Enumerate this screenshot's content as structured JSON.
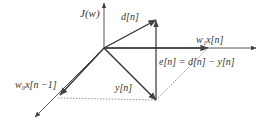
{
  "figure": {
    "labels": {
      "cost_axis": "J(w)",
      "desired": "d[n]",
      "w1_component": "w₁x[n]",
      "w0_component": "w₀x[n −1]",
      "output": "y[n]",
      "error": "e[n] = d[n] − y[n]"
    },
    "colors": {
      "line": "#444444",
      "dotted": "#777777",
      "text": "#333333"
    }
  }
}
